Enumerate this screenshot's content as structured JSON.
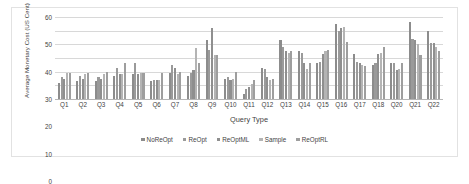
{
  "chart_data": {
    "type": "bar",
    "title": "",
    "xlabel": "Query Type",
    "ylabel": "Average Monetary Cost (US Cent)",
    "ylim": [
      0,
      60
    ],
    "yticks": [
      60,
      50,
      40,
      30,
      20,
      10,
      0
    ],
    "grid": true,
    "legend_position": "bottom",
    "categories": [
      "Q1",
      "Q2",
      "Q3",
      "Q4",
      "Q5",
      "Q6",
      "Q7",
      "Q8",
      "Q9",
      "Q10",
      "Q11",
      "Q12",
      "Q13",
      "Q14",
      "Q15",
      "Q16",
      "Q17",
      "Q18",
      "Q20",
      "Q21",
      "Q22"
    ],
    "series": [
      {
        "name": "NoReOpt",
        "color": "#8c8c8c",
        "values": [
          12,
          13,
          13,
          17,
          18,
          13,
          19,
          17,
          43,
          15,
          4,
          23,
          43,
          35,
          26,
          55,
          33,
          25,
          26,
          56,
          50
        ]
      },
      {
        "name": "ReOpt",
        "color": "#9a9a9a",
        "values": [
          16,
          17,
          16,
          23,
          26,
          14,
          25,
          19,
          36,
          16,
          7,
          22,
          38,
          34,
          27,
          50,
          27,
          26,
          26,
          44,
          41
        ]
      },
      {
        "name": "ReOptML",
        "color": "#8f8f8f",
        "values": [
          15,
          15,
          15,
          18,
          18,
          14,
          23,
          21,
          52,
          14,
          9,
          16,
          35,
          26,
          33,
          52,
          26,
          33,
          21,
          43,
          41
        ]
      },
      {
        "name": "Sample",
        "color": "#b4b4b4",
        "values": [
          19,
          18,
          18,
          18,
          19,
          14,
          18,
          37,
          32,
          15,
          11,
          14,
          34,
          22,
          35,
          53,
          25,
          34,
          22,
          40,
          38
        ]
      },
      {
        "name": "ReOptRL",
        "color": "#9e9e9e",
        "values": [
          19,
          19,
          20,
          26,
          19,
          19,
          20,
          26,
          32,
          20,
          14,
          15,
          35,
          26,
          36,
          42,
          24,
          38,
          26,
          32,
          35
        ]
      }
    ]
  },
  "axis": {
    "y_title": "Average Monetary Cost (US Cent)",
    "x_title": "Query Type"
  }
}
